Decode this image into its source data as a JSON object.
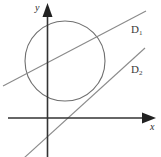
{
  "figure": {
    "title": "",
    "width": 161,
    "height": 157,
    "background_color": "#ffffff"
  },
  "axes": {
    "x_axis": {
      "label": "x",
      "color": "#333333",
      "y_pixel": 118,
      "x_start": 8,
      "x_end": 155,
      "arrow": "right"
    },
    "y_axis": {
      "label": "y",
      "color": "#333333",
      "x_pixel": 47,
      "y_start": 5,
      "y_end": 157,
      "arrow": "up"
    },
    "origin": {
      "x": 47,
      "y": 118
    }
  },
  "shapes": {
    "circle": {
      "name": "circle",
      "center_x": 65,
      "center_y": 61,
      "radius": 40,
      "stroke_color": "#6f6f6f",
      "fill": "none"
    },
    "lines": [
      {
        "id": "D1",
        "label": "D",
        "subscript": "1",
        "stroke_color": "#8a8a8a",
        "x1": 3,
        "y1": 86,
        "x2": 146,
        "y2": 11
      },
      {
        "id": "D2",
        "label": "D",
        "subscript": "2",
        "stroke_color": "#8a8a8a",
        "x1": 24,
        "y1": 158,
        "x2": 145,
        "y2": 48
      }
    ]
  },
  "chart_data": {
    "type": "scatter",
    "title": "",
    "xlabel": "x",
    "ylabel": "y",
    "grid": false,
    "legend": "none",
    "annotations": [
      "D1",
      "D2"
    ],
    "series": [
      {
        "name": "circle",
        "kind": "circle",
        "center": [
          65,
          61
        ],
        "radius": 40
      },
      {
        "name": "D1",
        "kind": "line",
        "points": [
          [
            3,
            86
          ],
          [
            146,
            11
          ]
        ]
      },
      {
        "name": "D2",
        "kind": "line",
        "points": [
          [
            24,
            158
          ],
          [
            145,
            48
          ]
        ]
      }
    ]
  }
}
